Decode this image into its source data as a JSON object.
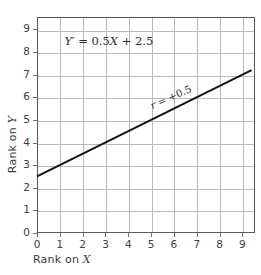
{
  "chart_data": {
    "type": "line",
    "title": "",
    "xlabel": "Rank on X",
    "ylabel": "Rank on Y",
    "xlim": [
      0,
      9.55
    ],
    "ylim": [
      0,
      9.55
    ],
    "xticks": [
      "0",
      "1",
      "2",
      "3",
      "4",
      "5",
      "6",
      "7",
      "8",
      "9"
    ],
    "yticks": [
      "0",
      "1",
      "2",
      "3",
      "4",
      "5",
      "6",
      "7",
      "8",
      "9"
    ],
    "xtick_values": [
      0,
      1,
      2,
      3,
      4,
      5,
      6,
      7,
      8,
      9
    ],
    "ytick_values": [
      0,
      1,
      2,
      3,
      4,
      5,
      6,
      7,
      8,
      9
    ],
    "grid": true,
    "legend": "none",
    "series": [
      {
        "name": "regression-line",
        "equation": "Y' = 0.5X + 2.5",
        "slope": 0.5,
        "intercept": 2.5,
        "x": [
          0,
          9.4
        ],
        "values": [
          2.5,
          7.2
        ],
        "color": "#111111"
      }
    ],
    "annotations": [
      {
        "name": "equation-label",
        "text_parts": {
          "lhs": "Y′",
          "eq": " = ",
          "slope": "0.5",
          "var": "X",
          "plus": " + ",
          "intercept": "2.5"
        },
        "text": "Y′ = 0.5X + 2.5",
        "x": 1.2,
        "y": 8.55
      },
      {
        "name": "correlation-label",
        "text_parts": {
          "sym": "r",
          "eq": " = ",
          "val": "+0.5"
        },
        "text": "r = +0.5",
        "x": 5.1,
        "y": 5.7,
        "rotation_deg": -24
      }
    ],
    "axis_color": "#58585a",
    "grid_color": "#b9b9bb",
    "background": "#ffffff"
  }
}
